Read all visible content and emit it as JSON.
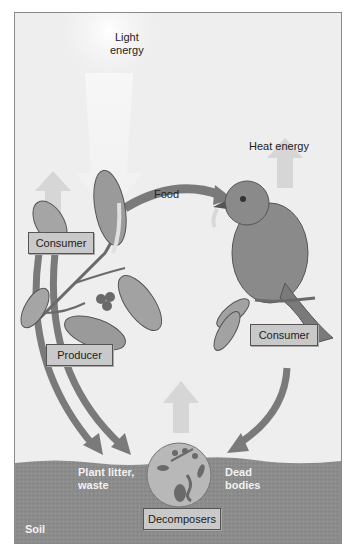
{
  "diagram": {
    "labels": {
      "light_energy": "Light\nenergy",
      "heat_energy": "Heat energy",
      "food": "Food",
      "consumer_plant": "Consumer",
      "producer": "Producer",
      "consumer_bird": "Consumer",
      "plant_litter": "Plant litter,\nwaste",
      "dead_bodies": "Dead\nbodies",
      "decomposers": "Decomposers",
      "soil": "Soil"
    },
    "colors": {
      "background": "#eeeeee",
      "soil": "#8c8c8c",
      "arrow": "#7a7a7a",
      "heat_arrow": "#d4d4d4",
      "box_fill": "#c9c9c9"
    }
  }
}
